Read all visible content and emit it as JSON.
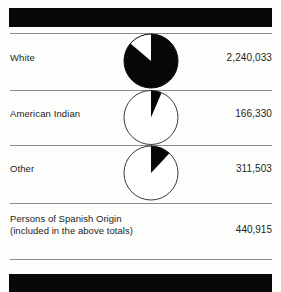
{
  "figure": {
    "background_color": "#fdfdfc",
    "rule_color": "#8d8d8d",
    "bar_color": "#070707",
    "ink_color": "#231f20"
  },
  "rows": [
    {
      "label": "White",
      "value": "2,240,033",
      "pie": {
        "name": "pie-white",
        "filled_fraction": 0.862,
        "fill_color": "#070707",
        "empty_color": "#ffffff",
        "stroke_color": "#070707"
      }
    },
    {
      "label": "American Indian",
      "value": "166,330",
      "pie": {
        "name": "pie-american-indian",
        "filled_fraction": 0.064,
        "fill_color": "#070707",
        "empty_color": "#ffffff",
        "stroke_color": "#3a3a3a"
      }
    },
    {
      "label": "Other",
      "value": "311,503",
      "pie": {
        "name": "pie-other",
        "filled_fraction": 0.12,
        "fill_color": "#070707",
        "empty_color": "#ffffff",
        "stroke_color": "#3a3a3a"
      }
    }
  ],
  "footnote": {
    "label_line1": "Persons of Spanish Origin",
    "label_line2": "(included in the above totals)",
    "value": "440,915"
  },
  "chart_data": {
    "type": "pie",
    "title": "",
    "categories": [
      "White",
      "American Indian",
      "Other"
    ],
    "values": [
      2240033,
      166330,
      311503
    ],
    "annotations": [
      "Persons of Spanish Origin (included in the above totals): 440,915"
    ],
    "legend": "none",
    "grid": false
  }
}
